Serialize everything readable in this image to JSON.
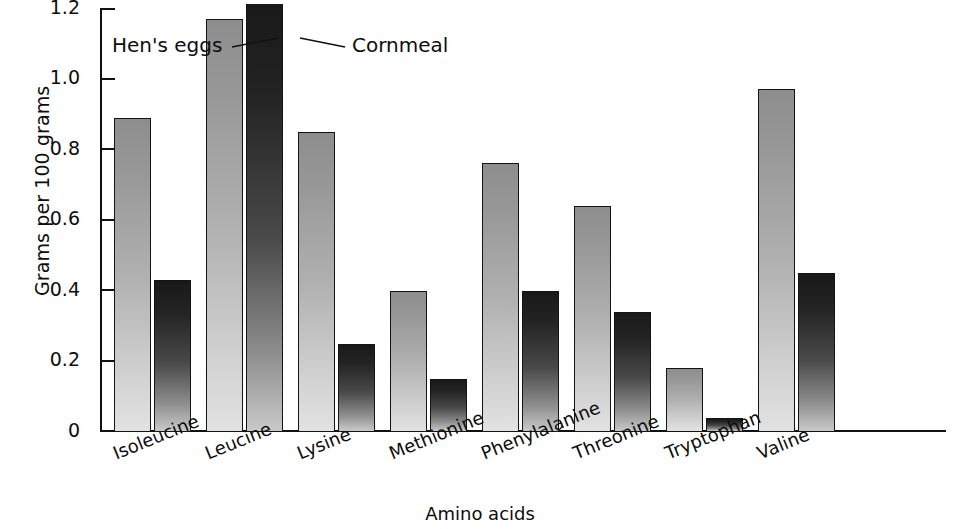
{
  "chart_data": {
    "type": "bar",
    "title": "",
    "subtitle": "",
    "xlabel": "Amino acids",
    "ylabel": "Grams per 100 grams",
    "ylim": [
      0,
      1.2
    ],
    "ytick_labels": [
      "1.2",
      "1.0",
      "0.8",
      "0.6",
      "0.4",
      "0.2",
      "0"
    ],
    "ytick_values": [
      1.2,
      1.0,
      0.8,
      0.6,
      0.4,
      0.2,
      0
    ],
    "grid": false,
    "legend_position": "inline-annotation",
    "categories": [
      "Isoleucine",
      "Leucine",
      "Lysine",
      "Methionine",
      "Phenylalanine",
      "Threonine",
      "Tryptophan",
      "Valine"
    ],
    "series": [
      {
        "name": "Hen's eggs",
        "color": "#b0b0b0",
        "values": [
          0.89,
          1.17,
          0.85,
          0.4,
          0.76,
          0.64,
          0.18,
          0.97
        ]
      },
      {
        "name": "Cornmeal",
        "color": "#242424",
        "values": [
          0.43,
          1.21,
          0.25,
          0.15,
          0.4,
          0.34,
          0.04,
          0.45
        ]
      }
    ],
    "annotations": [
      {
        "text": "Hen's eggs",
        "points_to": "Leucine / Hen's eggs bar"
      },
      {
        "text": "Cornmeal",
        "points_to": "Leucine / Cornmeal bar"
      }
    ]
  }
}
